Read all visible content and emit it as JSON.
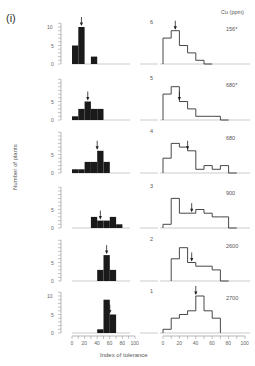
{
  "figure": {
    "panel_label": "(i)",
    "ylabel": "Number of plants",
    "xlabel": "Index of tolerance",
    "cu_header": "Cu (ppm)"
  },
  "chart_data": {
    "type": "bar",
    "title": "(i)",
    "xlabel": "Index of tolerance",
    "ylabel": "Number of plants",
    "xlim": [
      0,
      100
    ],
    "ylim": [
      0,
      12
    ],
    "x_ticks": [
      "0",
      "20",
      "40",
      "60",
      "80",
      "100"
    ],
    "y_ticks": [
      "0",
      "5",
      "10"
    ],
    "bin_width": 10,
    "legend_header": "Cu (ppm)",
    "rows": [
      {
        "row": "6",
        "cu_ppm": "156*",
        "left": {
          "bins": [
            0,
            10,
            20,
            30
          ],
          "counts": [
            5,
            10,
            0,
            2
          ],
          "arrow": 15
        },
        "right": {
          "bins": [
            0,
            10,
            20,
            30,
            40,
            50
          ],
          "heights": [
            7,
            9,
            5,
            3,
            1,
            0
          ],
          "arrow": 15
        }
      },
      {
        "row": "5",
        "cu_ppm": "680*",
        "left": {
          "bins": [
            0,
            10,
            20,
            30,
            40
          ],
          "counts": [
            1,
            3,
            5,
            3,
            3
          ],
          "arrow": 25
        },
        "right": {
          "bins": [
            0,
            10,
            20,
            30,
            40,
            50,
            60,
            70
          ],
          "heights": [
            7,
            9,
            5,
            3,
            1,
            1,
            1,
            0
          ],
          "arrow": 20
        },
        "note": "right panel heights are relative"
      },
      {
        "row": "4",
        "cu_ppm": "680",
        "left": {
          "bins": [
            0,
            10,
            20,
            30,
            40,
            50
          ],
          "counts": [
            1,
            1,
            3,
            3,
            6,
            3
          ],
          "arrow": 40
        },
        "right": {
          "bins": [
            0,
            10,
            20,
            30,
            40,
            50,
            60,
            70,
            80
          ],
          "heights": [
            4,
            8,
            7,
            6,
            1,
            2,
            1,
            2,
            0
          ],
          "arrow": 30
        }
      },
      {
        "row": "3",
        "cu_ppm": "900",
        "left": {
          "bins": [
            30,
            40,
            50,
            60,
            70
          ],
          "counts": [
            3,
            2,
            2,
            3,
            1
          ],
          "arrow": 45
        },
        "right": {
          "bins": [
            0,
            10,
            20,
            30,
            40,
            50,
            60,
            70,
            80
          ],
          "heights": [
            1,
            8,
            4,
            4,
            5,
            4,
            3,
            3,
            0
          ],
          "arrow": 35
        }
      },
      {
        "row": "2",
        "cu_ppm": "2600",
        "left": {
          "bins": [
            40,
            50,
            60
          ],
          "counts": [
            3,
            7,
            3
          ],
          "arrow": 55
        },
        "right": {
          "bins": [
            10,
            20,
            30,
            40,
            50,
            60,
            70
          ],
          "heights": [
            6,
            9,
            5,
            4,
            4,
            3,
            0
          ],
          "arrow": 35
        }
      },
      {
        "row": "1",
        "cu_ppm": "2700",
        "left": {
          "bins": [
            40,
            50,
            60
          ],
          "counts": [
            1,
            9,
            5
          ],
          "arrow": 60
        },
        "right": {
          "bins": [
            0,
            10,
            20,
            30,
            40,
            50,
            60
          ],
          "heights": [
            1,
            4,
            5,
            6,
            10,
            6,
            4
          ],
          "arrow": 40
        }
      }
    ]
  }
}
